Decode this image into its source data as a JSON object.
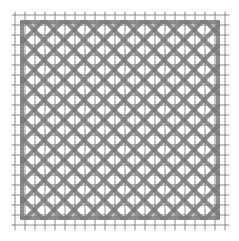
{
  "diagram": {
    "type": "grid-pattern",
    "grid": {
      "x0": 15,
      "y0": 15,
      "x1": 226,
      "y1": 227,
      "spacing": 10,
      "color": "#6e6e6e"
    },
    "pattern": {
      "color": "#7a7a7a",
      "stroke_width": 4,
      "inner_x0": 22,
      "inner_y0": 22,
      "inner_x1": 218,
      "inner_y1": 218,
      "step": 20
    }
  }
}
